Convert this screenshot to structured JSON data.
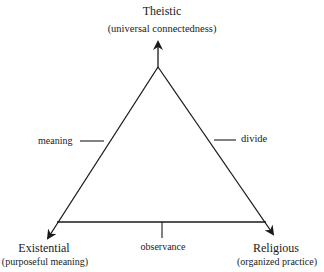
{
  "diagram": {
    "type": "triangle",
    "vertices": {
      "top": {
        "title": "Theistic",
        "subtitle": "(universal connectedness)"
      },
      "left": {
        "title": "Existential",
        "subtitle": "(purposeful meaning)"
      },
      "right": {
        "title": "Religious",
        "subtitle": "(organized practice)"
      }
    },
    "edges": {
      "left": {
        "label": "meaning"
      },
      "right": {
        "label": "divide"
      },
      "bottom": {
        "label": "observance"
      }
    },
    "colors": {
      "line": "#1a1a1a",
      "background": "#ffffff"
    }
  }
}
